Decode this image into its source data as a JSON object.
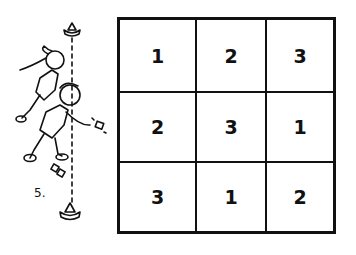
{
  "figure": {
    "step_label": "5.",
    "illustration": {
      "description": "two children in relay pose running alongside a dashed line between two cones, one tossing a bean bag",
      "elements": [
        "cone-top",
        "cone-bottom",
        "dashed-line",
        "child-girl-ponytail",
        "child-boy",
        "bean-bag-thrown",
        "bean-bags-dropped"
      ]
    },
    "grid": {
      "rows": 3,
      "cols": 3,
      "cells": [
        [
          "1",
          "2",
          "3"
        ],
        [
          "2",
          "3",
          "1"
        ],
        [
          "3",
          "1",
          "2"
        ]
      ]
    },
    "colors": {
      "ink": "#111111",
      "background": "#ffffff"
    }
  }
}
